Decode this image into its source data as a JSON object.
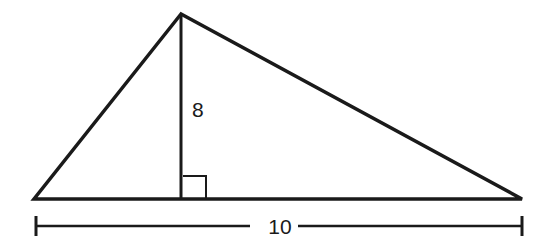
{
  "diagram": {
    "type": "triangle-with-altitude",
    "stroke_color": "#1a1a1a",
    "background": "#ffffff",
    "triangle": {
      "apex": [
        181,
        14
      ],
      "base_left": [
        34,
        199
      ],
      "base_right": [
        522,
        199
      ]
    },
    "altitude": {
      "label": "8",
      "from": [
        181,
        14
      ],
      "to": [
        181,
        199
      ]
    },
    "right_angle_marker": {
      "x": 183,
      "y": 176,
      "size": 23
    },
    "base_dimension": {
      "label": "10",
      "y": 226,
      "x_start": 36,
      "x_end": 522
    }
  }
}
